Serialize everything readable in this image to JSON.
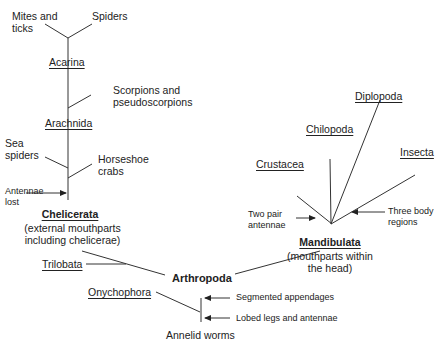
{
  "diagram": {
    "root": "Arthropoda",
    "outgroup": "Annelid worms",
    "root_traits": [
      "Segmented appendages",
      "Lobed legs and antennae"
    ],
    "side_taxa": [
      "Onychophora",
      "Trilobata"
    ],
    "chelicerata": {
      "name": "Chelicerata",
      "desc_line1": "(external mouthparts",
      "desc_line2": "including chelicerae)",
      "trait": [
        "Antennae",
        "lost"
      ],
      "groups": {
        "sea_spiders": [
          "Sea",
          "spiders"
        ],
        "horseshoe": [
          "Horseshoe",
          "crabs"
        ],
        "arachnida": "Arachnida",
        "scorpions": [
          "Scorpions and",
          "pseudoscorpions"
        ],
        "acarina": "Acarina",
        "mites": [
          "Mites and",
          "ticks"
        ],
        "spiders": "Spiders"
      }
    },
    "mandibulata": {
      "name": "Mandibulata",
      "desc_line1": "(mouthparts within",
      "desc_line2": "the head)",
      "trait_left": [
        "Two pair",
        "antennae"
      ],
      "trait_right": [
        "Three body",
        "regions"
      ],
      "groups": [
        "Crustacea",
        "Chilopoda",
        "Diplopoda",
        "Insecta"
      ]
    }
  }
}
